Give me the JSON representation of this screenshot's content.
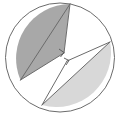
{
  "figure": {
    "canvas": {
      "width": 120,
      "height": 117,
      "background": "#ffffff"
    },
    "colors": {
      "stroke": "#6b6b6b",
      "stroke_light": "#8a8a8a",
      "dark_fill": "#a8a8a8",
      "light_fill": "#d8d8d8",
      "white_fill": "#ffffff",
      "mark_stroke": "#555555"
    },
    "circle": {
      "name": "outer-circle",
      "cx": 60,
      "cy": 57.5,
      "r": 54.5,
      "stroke_width": 1
    },
    "points": [
      {
        "id": "top",
        "label": "",
        "x": 70,
        "y": 4
      },
      {
        "id": "left_low",
        "label": "",
        "x": 20.5,
        "y": 80
      },
      {
        "id": "right",
        "label": "",
        "x": 110,
        "y": 42
      },
      {
        "id": "bottom",
        "label": "",
        "x": 42,
        "y": 105
      },
      {
        "id": "center_upper",
        "label": "",
        "x": 64,
        "y": 53
      },
      {
        "id": "center_lower",
        "label": "",
        "x": 67,
        "y": 61
      }
    ],
    "regions": [
      {
        "id": "dark-sector",
        "name": "dark-shaded-sector",
        "fill": "#a8a8a8",
        "path": "M 70 4 L 64 53 L 20.5 80 A 54.5 54.5 0 0 1 70 4 Z"
      },
      {
        "id": "light-sector",
        "name": "light-shaded-sector",
        "fill": "#d8d8d8",
        "path": "M 110 42 L 42 105 A 54.5 54.5 0 0 0 110 42 Z"
      },
      {
        "id": "white-upper-right",
        "name": "white-region-upper-right",
        "fill": "#ffffff",
        "path": "M 70 4 A 54.5 54.5 0 0 1 110 42 L 64 53 Z"
      },
      {
        "id": "white-lower-left",
        "name": "white-region-lower-left",
        "fill": "#ffffff",
        "path": "M 20.5 80 A 54.5 54.5 0 0 0 42 105 L 67 61 Z"
      }
    ],
    "chords": [
      {
        "id": "chord-top-leftlow",
        "name": "chord-top-to-lower-left",
        "x1": 70,
        "y1": 4,
        "x2": 20.5,
        "y2": 80
      },
      {
        "id": "chord-top-center",
        "name": "chord-top-to-centre",
        "x1": 70,
        "y1": 4,
        "x2": 64,
        "y2": 53
      },
      {
        "id": "chord-center-leftlow",
        "name": "chord-centre-to-lower-left",
        "x1": 64,
        "y1": 53,
        "x2": 20.5,
        "y2": 80
      },
      {
        "id": "chord-right-bottom",
        "name": "chord-right-to-bottom",
        "x1": 110,
        "y1": 42,
        "x2": 42,
        "y2": 105
      },
      {
        "id": "chord-right-center",
        "name": "chord-right-to-centre",
        "x1": 110,
        "y1": 42,
        "x2": 67,
        "y2": 61
      },
      {
        "id": "chord-center-bottom",
        "name": "chord-centre-to-bottom",
        "x1": 67,
        "y1": 61,
        "x2": 42,
        "y2": 105
      }
    ],
    "angle_marks": [
      {
        "id": "right-angle-upper",
        "name": "right-angle-marker-upper",
        "label": "",
        "path": "M 59 49 L 64 52.5 L 60.5 57"
      },
      {
        "id": "right-angle-lower",
        "name": "right-angle-marker-lower",
        "label": "",
        "path": "M 64 58 L 69 60.5 L 66 65"
      }
    ],
    "labels": []
  }
}
